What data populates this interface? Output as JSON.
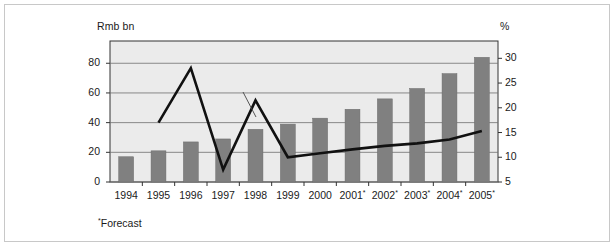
{
  "chart_data": {
    "type": "bar",
    "title": "",
    "subtitle": "",
    "categories": [
      "1994",
      "1995",
      "1996",
      "1997",
      "1998",
      "1999",
      "2000",
      "2001*",
      "2002*",
      "2003*",
      "2004*",
      "2005*"
    ],
    "series": [
      {
        "name": "Rmb bn",
        "type": "bar",
        "axis": "left",
        "values": [
          17,
          21,
          27,
          29,
          35.5,
          39,
          43,
          49,
          56,
          63,
          73,
          84
        ]
      },
      {
        "name": "% annual growth, right axis",
        "type": "line",
        "axis": "right",
        "x": [
          "1995",
          "1996",
          "1997",
          "1998",
          "1999",
          "2000",
          "2001*",
          "2002*",
          "2003*",
          "2004*",
          "2005*"
        ],
        "values": [
          17.0,
          28.0,
          7.5,
          21.5,
          10.0,
          10.8,
          11.6,
          12.3,
          12.8,
          13.6,
          15.3
        ]
      }
    ],
    "xlabel": "",
    "ylabel": "Rmb bn",
    "y2label": "%",
    "ylim": [
      0,
      95
    ],
    "y2lim": [
      5,
      33.5
    ],
    "yticks": [
      "0",
      "20",
      "40",
      "60",
      "80"
    ],
    "ytick_values": [
      0,
      20,
      40,
      60,
      80
    ],
    "y2ticks": [
      "5",
      "10",
      "15",
      "20",
      "25",
      "30"
    ],
    "y2tick_values": [
      5,
      10,
      15,
      20,
      25,
      30
    ],
    "grid": true,
    "legend": "none",
    "annotations": [
      {
        "text": "% annual growth, right axis",
        "target_x": "1998",
        "target_y": 21.5
      }
    ],
    "footnote": "*Forecast",
    "colors": {
      "bar": "#808080",
      "line": "#111111",
      "plot_background": "#ebebeb",
      "grid": "#6e6e6e",
      "axis": "#333333",
      "frame": "#c8c8c8",
      "text": "#1a1a1a"
    }
  },
  "axes": {
    "left_title": "Rmb bn",
    "right_title": "%"
  },
  "footnote": {
    "marker": "*",
    "text": "Forecast"
  },
  "annotation": {
    "label": "% annual growth, right axis"
  },
  "ticks": {
    "left": [
      "80",
      "60",
      "40",
      "20",
      "0"
    ],
    "right": [
      "30",
      "25",
      "20",
      "15",
      "10",
      "5"
    ],
    "x": [
      {
        "year": "1994",
        "forecast": ""
      },
      {
        "year": "1995",
        "forecast": ""
      },
      {
        "year": "1996",
        "forecast": ""
      },
      {
        "year": "1997",
        "forecast": ""
      },
      {
        "year": "1998",
        "forecast": ""
      },
      {
        "year": "1999",
        "forecast": ""
      },
      {
        "year": "2000",
        "forecast": ""
      },
      {
        "year": "2001",
        "forecast": "*"
      },
      {
        "year": "2002",
        "forecast": "*"
      },
      {
        "year": "2003",
        "forecast": "*"
      },
      {
        "year": "2004",
        "forecast": "*"
      },
      {
        "year": "2005",
        "forecast": "*"
      }
    ]
  }
}
